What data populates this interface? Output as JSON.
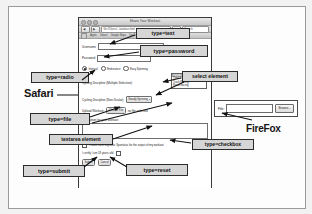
{
  "browser_window": {
    "title": "Share Your Workout",
    "toolbar": {
      "back_label": "◀",
      "forward_label": "▶",
      "url_value": "file:///Users/.../workout.html",
      "search_placeholder": "Search",
      "reload_label": "↻"
    },
    "bookmarks": [
      "Apple",
      "Yahoo!",
      "Google Maps",
      "YouTube",
      "Wikipedia",
      "News"
    ]
  },
  "form": {
    "fields": {
      "username_label": "Username",
      "username_value": "",
      "password_label": "Password",
      "password_value": ""
    },
    "radio_group": {
      "label": "",
      "options": [
        {
          "label": "Interval",
          "checked": true
        },
        {
          "label": "Endurance",
          "checked": false
        },
        {
          "label": "Easy Spinning",
          "checked": false
        }
      ]
    },
    "multi_select": {
      "label": "Cycling Discipline (Multiple Selection):",
      "options": [
        {
          "label": "Steady Spinning",
          "selected": true
        },
        {
          "label": "Time Trialing",
          "selected": false
        },
        {
          "label": "Track Racing",
          "selected": false
        },
        {
          "label": "Road Racing",
          "selected": false
        }
      ]
    },
    "dropdown": {
      "label": "Cycling Discipline (Non-Scalar):",
      "value": "Steady Spinning",
      "caret": "▾"
    },
    "file_field": {
      "label": "Upload Workout:",
      "button_label": "Choose File",
      "status_text": "no file selected"
    },
    "textarea": {
      "label": "Description for your workout:",
      "value": ""
    },
    "checkbox_notify": {
      "label": "Please have Bigstatic Sportatus for the output of my workout.",
      "checked": true
    },
    "checkbox_certify": {
      "label": "I certify I am 18 years old.",
      "checked": false
    },
    "buttons": {
      "submit_label": "Submit",
      "reset_label": "Cancel"
    }
  },
  "firefox_inset": {
    "file_label": "File:",
    "file_value": "",
    "browse_label": "Browse..."
  },
  "browser_names": {
    "safari": "Safari",
    "firefox": "FireFox"
  },
  "callouts": {
    "text": "type=text",
    "password": "type=password",
    "radio": "type=radio",
    "select": "select element",
    "file": "type=file",
    "textarea": "textarea element",
    "checkbox": "type=checkbox",
    "submit": "type=submit",
    "reset": "type=reset"
  }
}
